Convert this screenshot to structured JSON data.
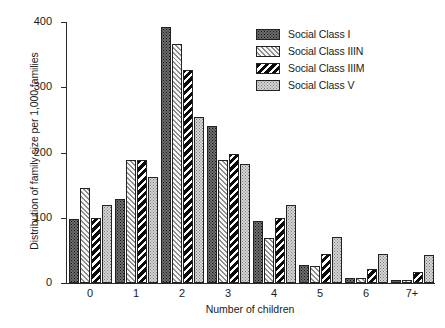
{
  "chart_data": {
    "type": "bar",
    "title": "",
    "xlabel": "Number of children",
    "ylabel": "Distribution of family size per 1,000 families",
    "categories": [
      "0",
      "1",
      "2",
      "3",
      "4",
      "5",
      "6",
      "7+"
    ],
    "ylim": [
      0,
      400
    ],
    "yticks": [
      0,
      100,
      200,
      300,
      400
    ],
    "ytick_labels": [
      "0",
      "100",
      "200",
      "300",
      "400"
    ],
    "grid": false,
    "legend_position": "top-right",
    "series": [
      {
        "name": "Social Class I",
        "pattern": "dark-dotted",
        "color": "#6f6f6f",
        "values": [
          98,
          128,
          392,
          241,
          95,
          28,
          8,
          4
        ]
      },
      {
        "name": "Social Class IIIN",
        "pattern": "light-diagonal-hatch",
        "color": "#f2f2f2",
        "values": [
          145,
          188,
          367,
          188,
          69,
          26,
          8,
          5
        ]
      },
      {
        "name": "Social Class IIIM",
        "pattern": "black-diagonal-hatch",
        "color": "#0c0c0c",
        "values": [
          99,
          188,
          327,
          198,
          99,
          45,
          21,
          17
        ]
      },
      {
        "name": "Social Class V",
        "pattern": "grey-dotted",
        "color": "#d4d4d4",
        "values": [
          120,
          162,
          254,
          183,
          119,
          70,
          44,
          43
        ]
      }
    ]
  }
}
